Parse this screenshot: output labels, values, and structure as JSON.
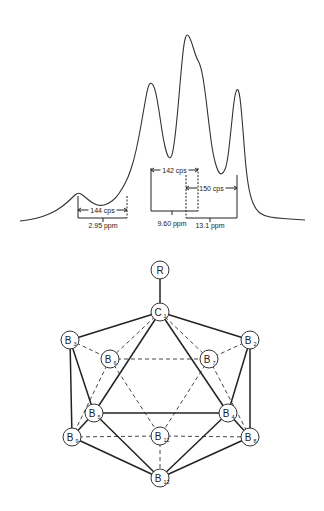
{
  "spectrum": {
    "baseline_y": 220,
    "path_points": [
      [
        20,
        221
      ],
      [
        35,
        219
      ],
      [
        50,
        214
      ],
      [
        62,
        207
      ],
      [
        72,
        198
      ],
      [
        78,
        192
      ],
      [
        84,
        196
      ],
      [
        92,
        203
      ],
      [
        100,
        206
      ],
      [
        108,
        204
      ],
      [
        116,
        198
      ],
      [
        122,
        189
      ],
      [
        128,
        178
      ],
      [
        134,
        160
      ],
      [
        139,
        137
      ],
      [
        144,
        108
      ],
      [
        148,
        86
      ],
      [
        151,
        82
      ],
      [
        155,
        88
      ],
      [
        159,
        110
      ],
      [
        163,
        138
      ],
      [
        167,
        155
      ],
      [
        170,
        159
      ],
      [
        173,
        153
      ],
      [
        177,
        120
      ],
      [
        181,
        72
      ],
      [
        184,
        42
      ],
      [
        187,
        33
      ],
      [
        191,
        40
      ],
      [
        196,
        57
      ],
      [
        201,
        66
      ],
      [
        205,
        90
      ],
      [
        209,
        125
      ],
      [
        213,
        155
      ],
      [
        218,
        172
      ],
      [
        222,
        175
      ],
      [
        227,
        166
      ],
      [
        231,
        130
      ],
      [
        234,
        100
      ],
      [
        237,
        87
      ],
      [
        240,
        95
      ],
      [
        243,
        130
      ],
      [
        246,
        170
      ],
      [
        250,
        196
      ],
      [
        256,
        210
      ],
      [
        264,
        216
      ],
      [
        276,
        218
      ],
      [
        290,
        219
      ],
      [
        305,
        220
      ]
    ],
    "stroke_color": "#333333"
  },
  "annotations": [
    {
      "id": "coupling-144",
      "label": "144 cps",
      "left_x": 78,
      "right_x": 127,
      "top_y": 196,
      "arrow_y": 210,
      "bottom_y": 218,
      "tick_x": 103,
      "left_dashed": false,
      "right_dashed": true,
      "shift_label": "2.95 ppm",
      "shift_label_y": 228
    },
    {
      "id": "coupling-142",
      "label": "142 cps",
      "left_x": 151,
      "right_x": 198,
      "top_y": 168,
      "arrow_y": 170,
      "bottom_y": 211,
      "tick_x": 172,
      "left_dashed": false,
      "right_dashed": true,
      "shift_label": "9.60 ppm",
      "shift_label_y": 226
    },
    {
      "id": "coupling-150",
      "label": "150 cps",
      "left_x": 186,
      "right_x": 237,
      "top_y": 175,
      "arrow_y": 188,
      "bottom_y": 218,
      "tick_x": 210,
      "left_dashed": true,
      "right_dashed": false,
      "shift_label": "13.1 ppm",
      "shift_label_y": 228
    }
  ],
  "molecule": {
    "atoms": [
      {
        "id": "R",
        "main": "R",
        "sub": "",
        "x": 160,
        "y": 270
      },
      {
        "id": "C1",
        "main": "C",
        "sub": "1",
        "x": 160,
        "y": 312
      },
      {
        "id": "B3",
        "main": "B",
        "sub": "3",
        "x": 70,
        "y": 340
      },
      {
        "id": "B2",
        "main": "B",
        "sub": "2",
        "x": 250,
        "y": 340
      },
      {
        "id": "B6",
        "main": "B",
        "sub": "6",
        "x": 110,
        "y": 359
      },
      {
        "id": "B7",
        "main": "B",
        "sub": "7",
        "x": 209,
        "y": 359
      },
      {
        "id": "B5",
        "main": "B",
        "sub": "5",
        "x": 94,
        "y": 413
      },
      {
        "id": "B4",
        "main": "B",
        "sub": "4",
        "x": 228,
        "y": 413
      },
      {
        "id": "B9",
        "main": "B",
        "sub": "9",
        "x": 72,
        "y": 437
      },
      {
        "id": "B11",
        "main": "B",
        "sub": "11",
        "x": 160,
        "y": 436
      },
      {
        "id": "B8",
        "main": "B",
        "sub": "8",
        "x": 250,
        "y": 437
      },
      {
        "id": "B12",
        "main": "B",
        "sub": "12",
        "x": 160,
        "y": 478
      }
    ],
    "solid_bonds": [
      [
        "R",
        "C1"
      ],
      [
        "C1",
        "B3"
      ],
      [
        "C1",
        "B2"
      ],
      [
        "C1",
        "B5"
      ],
      [
        "C1",
        "B4"
      ],
      [
        "B3",
        "B5"
      ],
      [
        "B3",
        "B9"
      ],
      [
        "B2",
        "B4"
      ],
      [
        "B2",
        "B8"
      ],
      [
        "B5",
        "B4"
      ],
      [
        "B5",
        "B9"
      ],
      [
        "B5",
        "B12"
      ],
      [
        "B4",
        "B8"
      ],
      [
        "B4",
        "B12"
      ],
      [
        "B9",
        "B12"
      ],
      [
        "B8",
        "B12"
      ]
    ],
    "dashed_bonds": [
      [
        "C1",
        "B6"
      ],
      [
        "C1",
        "B7"
      ],
      [
        "B3",
        "B6"
      ],
      [
        "B2",
        "B7"
      ],
      [
        "B6",
        "B7"
      ],
      [
        "B6",
        "B11"
      ],
      [
        "B7",
        "B11"
      ],
      [
        "B6",
        "B9"
      ],
      [
        "B7",
        "B8"
      ],
      [
        "B9",
        "B11"
      ],
      [
        "B11",
        "B8"
      ],
      [
        "B11",
        "B12"
      ]
    ],
    "atom_radius": 9
  }
}
